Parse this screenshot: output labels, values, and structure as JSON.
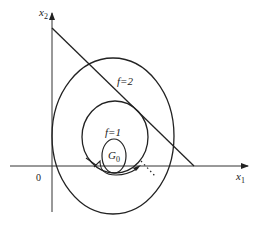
{
  "diagram": {
    "axes": {
      "x_label": "x",
      "x_sub": "1",
      "y_label": "x",
      "y_sub": "2",
      "origin_label": "0"
    },
    "curves": [
      {
        "name": "outer-contour",
        "label": "f=2"
      },
      {
        "name": "inner-contour",
        "label": "f=1"
      },
      {
        "name": "feasible-region",
        "label": "G",
        "label_sub": "0"
      }
    ],
    "constraint_line": "linear constraint boundary",
    "colors": {
      "stroke": "#222222",
      "background": "#ffffff"
    }
  }
}
